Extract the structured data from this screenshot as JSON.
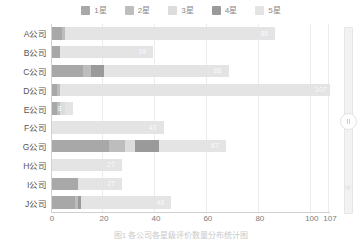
{
  "legend": {
    "position": "top-center",
    "items": [
      {
        "label": "1星",
        "color": "#a8a8a8"
      },
      {
        "label": "2星",
        "color": "#bdbdbd"
      },
      {
        "label": "3星",
        "color": "#dcdcdc"
      },
      {
        "label": "4星",
        "color": "#9a9a9a"
      },
      {
        "label": "5星",
        "color": "#e4e4e4"
      }
    ]
  },
  "caption": {
    "text": "图1  各公司各星级评价数量分布统计图"
  },
  "scrollbar": {
    "name": "vertical-scrollbar",
    "handle_label": "",
    "down_arrow": "▼",
    "edge_tick": "107"
  },
  "chart_data": {
    "type": "bar",
    "orientation": "horizontal",
    "stacked": true,
    "title": "",
    "subtitle": "",
    "xlabel": "",
    "ylabel": "",
    "grid": true,
    "xlim": [
      0,
      107
    ],
    "xticks": [
      0,
      20,
      40,
      60,
      80,
      100,
      107
    ],
    "xtick_labels": [
      "0",
      "20",
      "40",
      "60",
      "80",
      "100",
      "107"
    ],
    "categories": [
      "A公司",
      "B公司",
      "C公司",
      "D公司",
      "E公司",
      "F公司",
      "G公司",
      "H公司",
      "I公司",
      "J公司"
    ],
    "series": [
      {
        "name": "1星",
        "color": "#a8a8a8",
        "values": [
          4,
          3,
          12,
          2,
          2,
          0,
          22,
          0,
          10,
          9
        ]
      },
      {
        "name": "2星",
        "color": "#bdbdbd",
        "values": [
          1,
          0,
          3,
          1,
          1,
          0,
          6,
          0,
          0,
          1
        ]
      },
      {
        "name": "3星",
        "color": "#dcdcdc",
        "values": [
          0,
          0,
          0,
          0,
          2,
          0,
          4,
          0,
          0,
          0
        ]
      },
      {
        "name": "4星",
        "color": "#9a9a9a",
        "values": [
          0,
          0,
          5,
          0,
          0,
          0,
          9,
          0,
          0,
          1
        ]
      },
      {
        "name": "5星",
        "color": "#e4e4e4",
        "values": [
          81,
          36,
          48,
          104,
          3,
          43,
          26,
          27,
          17,
          35
        ]
      }
    ],
    "totals": [
      86,
      39,
      68,
      107,
      8,
      43,
      67,
      27,
      27,
      46
    ],
    "total_labels": [
      "86",
      "39",
      "68",
      "107",
      "8",
      "43",
      "67",
      "27",
      "27",
      "46"
    ]
  }
}
